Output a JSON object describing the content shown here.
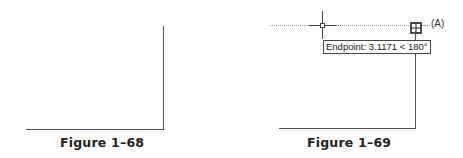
{
  "figures": [
    {
      "id": "fig-68",
      "caption": "Figure 1–68"
    },
    {
      "id": "fig-69",
      "caption": "Figure 1–69",
      "tooltip": "Endpoint: 3.1171 < 180°",
      "point_label": "(A)"
    }
  ],
  "colors": {
    "line": "#555555",
    "tracking": "#999999",
    "text": "#222222"
  }
}
